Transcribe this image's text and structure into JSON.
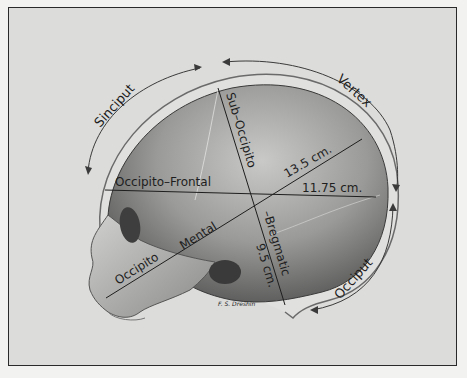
{
  "figure": {
    "regions": {
      "sinciput": "Sinciput",
      "vertex": "Vertex",
      "occiput": "Occiput"
    },
    "diameters": {
      "occipito_frontal": {
        "label": "Occipito–Frontal",
        "value": "11.75 cm."
      },
      "occipito_mental": {
        "label_part1": "Occipito",
        "label_part2": "Mental",
        "value": "13.5 cm."
      },
      "sub_occipito_bregmatic": {
        "label_part1": "Sub–Occipito",
        "label_part2": "–Bregmatic",
        "value": "9.5 cm."
      }
    },
    "signature": "F. S. Dreshin",
    "colors": {
      "background": "#dcdcda",
      "frame": "#2a2a2a",
      "ink": "#1e1e1e",
      "skull_dark": "#5a5a5a",
      "skull_light": "#b5b5b3"
    }
  }
}
